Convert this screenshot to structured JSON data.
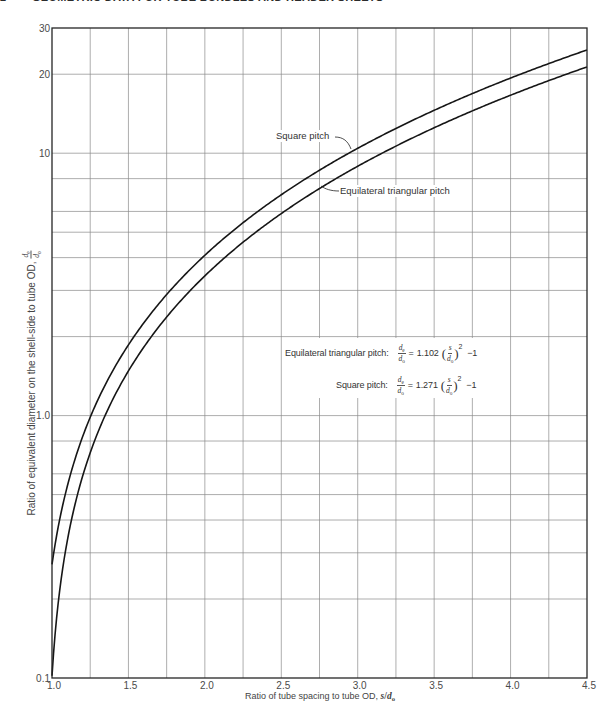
{
  "header": {
    "page_number": "2",
    "running_title": "GEOMETRIC DATA FOR TUBE BUNDLES AND HEADER SHEETS"
  },
  "chart_data": {
    "type": "line",
    "title": "",
    "xlabel": "Ratio of tube spacing  to tube OD, ",
    "xlabel_symbol": {
      "num": "s",
      "slash": "/",
      "den": "d",
      "den_sub": "o"
    },
    "ylabel": "Ratio of equivalent diameter on the shell-side to tube OD, ",
    "ylabel_symbol": {
      "num": "d",
      "num_sub": "e",
      "den": "d",
      "den_sub": "o"
    },
    "xlim": [
      1.0,
      4.5
    ],
    "ylim": [
      0.1,
      30
    ],
    "xscale": "linear",
    "yscale": "log",
    "grid": true,
    "x_gridlines": [
      1.25,
      1.5,
      1.75,
      2.0,
      2.25,
      2.5,
      2.75,
      3.0,
      3.25,
      3.5,
      3.75,
      4.0,
      4.25
    ],
    "y_gridlines": [
      0.2,
      0.3,
      0.4,
      0.5,
      0.6,
      0.8,
      1,
      2,
      3,
      4,
      5,
      6,
      8,
      10,
      20
    ],
    "x_ticks": [
      {
        "value": 1.0,
        "label": "1.0"
      },
      {
        "value": 1.5,
        "label": "1.5"
      },
      {
        "value": 2.0,
        "label": "2.0"
      },
      {
        "value": 2.5,
        "label": "2.5"
      },
      {
        "value": 3.0,
        "label": "3.0"
      },
      {
        "value": 3.5,
        "label": "3.5"
      },
      {
        "value": 4.0,
        "label": "4.0"
      },
      {
        "value": 4.5,
        "label": "4.5"
      }
    ],
    "y_ticks": [
      {
        "value": 0.1,
        "label": "0.1"
      },
      {
        "value": 1,
        "label": "1.0"
      },
      {
        "value": 10,
        "label": "10"
      },
      {
        "value": 20,
        "label": "20"
      },
      {
        "value": 30,
        "label": "30"
      }
    ],
    "series": [
      {
        "name": "Square pitch",
        "equation": {
          "coefficient": 1.271,
          "exponent": 2,
          "constant": -1
        },
        "x": [
          1.0,
          1.25,
          1.5,
          1.75,
          2.0,
          2.25,
          2.5,
          2.75,
          3.0,
          3.25,
          3.5,
          3.75,
          4.0,
          4.25,
          4.5
        ],
        "y": [
          0.271,
          0.986,
          1.86,
          2.892,
          4.084,
          5.434,
          6.944,
          8.612,
          10.439,
          12.425,
          14.57,
          16.873,
          19.336,
          21.957,
          24.738
        ]
      },
      {
        "name": "Equilateral triangular pitch",
        "equation": {
          "coefficient": 1.102,
          "exponent": 2,
          "constant": -1
        },
        "x": [
          1.0,
          1.25,
          1.5,
          1.75,
          2.0,
          2.25,
          2.5,
          2.75,
          3.0,
          3.25,
          3.5,
          3.75,
          4.0,
          4.25,
          4.5
        ],
        "y": [
          0.102,
          0.722,
          1.48,
          2.375,
          3.408,
          4.579,
          5.888,
          7.334,
          8.918,
          10.64,
          12.5,
          14.497,
          16.632,
          18.905,
          21.316
        ]
      }
    ]
  },
  "annotations": {
    "square_pitch_label": "Square pitch",
    "triangular_pitch_label": "Equilateral triangular pitch",
    "formulas": [
      {
        "label": "Equilateral triangular pitch:",
        "lhs_num": "d",
        "lhs_num_sub": "e",
        "lhs_den": "d",
        "lhs_den_sub": "o",
        "equals": "=",
        "coefficient": "1.102",
        "open_paren": "(",
        "rhs_num": "s",
        "rhs_den": "d",
        "rhs_den_sub": "o",
        "close_paren": ")",
        "exponent": "2",
        "constant": "−1"
      },
      {
        "label": "Square pitch:",
        "lhs_num": "d",
        "lhs_num_sub": "e",
        "lhs_den": "d",
        "lhs_den_sub": "o",
        "equals": "=",
        "coefficient": "1.271",
        "open_paren": "(",
        "rhs_num": "s",
        "rhs_den": "d",
        "rhs_den_sub": "o",
        "close_paren": ")",
        "exponent": "2",
        "constant": "−1"
      }
    ]
  }
}
